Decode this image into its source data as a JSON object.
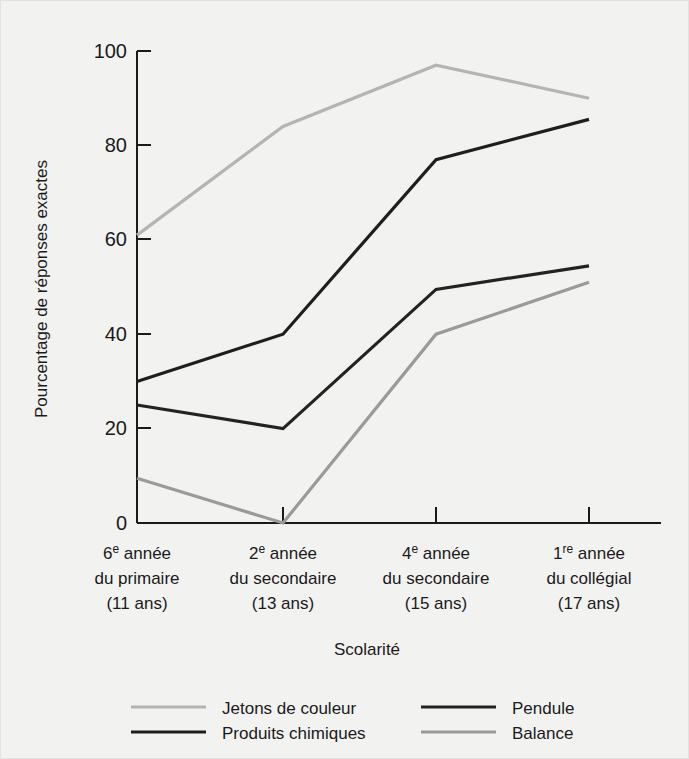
{
  "chart_data": {
    "type": "line",
    "title": "",
    "xlabel": "Scolarité",
    "ylabel": "Pourcentage de réponses exactes",
    "ylim": [
      0,
      100
    ],
    "yticks": [
      0,
      20,
      40,
      60,
      80,
      100
    ],
    "ytick_labels": [
      "0",
      "20",
      "40",
      "60",
      "80",
      "100"
    ],
    "grid": false,
    "legend_position": "bottom",
    "categories": [
      "6e année\ndu primaire\n(11 ans)",
      "2e année\ndu secondaire\n(13 ans)",
      "4e année\ndu secondaire\n(15 ans)",
      "1re année\ndu collégial\n(17 ans)"
    ],
    "category_parts": [
      {
        "num": "6",
        "sup": "e",
        "rest": " année",
        "line2": "du primaire",
        "line3": "(11 ans)"
      },
      {
        "num": "2",
        "sup": "e",
        "rest": " année",
        "line2": "du secondaire",
        "line3": "(13 ans)"
      },
      {
        "num": "4",
        "sup": "e",
        "rest": " année",
        "line2": "du secondaire",
        "line3": "(15 ans)"
      },
      {
        "num": "1",
        "sup": "re",
        "rest": " année",
        "line2": "du collégial",
        "line3": "(17 ans)"
      }
    ],
    "series": [
      {
        "name": "Jetons de couleur",
        "color": "#b4b4b4",
        "values": [
          61,
          84,
          97,
          90
        ]
      },
      {
        "name": "Produits chimiques",
        "color": "#1e1e1e",
        "values": [
          30,
          40,
          77,
          85.5
        ]
      },
      {
        "name": "Pendule",
        "color": "#232323",
        "values": [
          25,
          20,
          49.5,
          54.5
        ]
      },
      {
        "name": "Balance",
        "color": "#9a9a9a",
        "values": [
          9.5,
          0,
          40,
          51
        ]
      }
    ]
  },
  "legend": {
    "entries": [
      {
        "label": "Jetons de couleur",
        "color": "#b4b4b4"
      },
      {
        "label": "Produits chimiques",
        "color": "#1e1e1e"
      },
      {
        "label": "Pendule",
        "color": "#232323"
      },
      {
        "label": "Balance",
        "color": "#9a9a9a"
      }
    ]
  },
  "axis": {
    "x_title": "Scolarité",
    "y_title": "Pourcentage de réponses exactes"
  },
  "colors": {
    "background": "#f2f2f1",
    "axis": "#1a1a1a",
    "light_gray": "#b4b4b4",
    "mid_gray": "#9a9a9a",
    "dark": "#1e1e1e"
  }
}
